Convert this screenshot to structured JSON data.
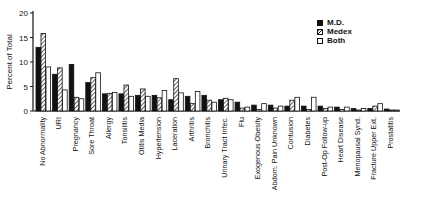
{
  "chart_data": {
    "type": "bar",
    "title": "",
    "xlabel": "",
    "ylabel": "Percent of Total",
    "ylim": [
      0,
      20
    ],
    "yticks": [
      0,
      5,
      10,
      15,
      20
    ],
    "grid": false,
    "legend_position": "top-right",
    "categories": [
      "No Abnormality",
      "URI",
      "Pregnancy",
      "Sore Throat",
      "Allergy",
      "Tonsilitis",
      "Otitis Media",
      "Hypertension",
      "Laceration",
      "Arthritis",
      "Bronchitis",
      "Urinary Tract Infec.",
      "Flu",
      "Exogenous Obesity",
      "Abdom. Pain Unknown",
      "Contusion",
      "Diabetes",
      "Post-Op Follow-up",
      "Heart Disease",
      "Menopausal Synd.",
      "Fracture Upper Ext.",
      "Prostatitis"
    ],
    "series": [
      {
        "name": "M.D.",
        "style": "solid",
        "values": [
          13.0,
          7.5,
          9.5,
          5.8,
          3.5,
          3.5,
          3.2,
          3.2,
          2.3,
          3.0,
          3.2,
          2.3,
          1.8,
          1.2,
          1.2,
          1.0,
          1.0,
          1.0,
          0.8,
          0.5,
          0.5,
          0.4
        ]
      },
      {
        "name": "Medex",
        "style": "hatched",
        "values": [
          15.8,
          8.8,
          2.8,
          6.8,
          3.6,
          5.3,
          4.5,
          2.7,
          6.6,
          1.5,
          2.2,
          2.6,
          0.6,
          0.3,
          0.6,
          2.2,
          0.3,
          0.5,
          0.3,
          0.2,
          1.0,
          0.2
        ]
      },
      {
        "name": "Both",
        "style": "open",
        "values": [
          9.0,
          4.3,
          2.5,
          7.8,
          3.8,
          3.0,
          3.0,
          4.2,
          3.7,
          4.0,
          1.8,
          2.3,
          0.8,
          1.5,
          1.0,
          2.8,
          2.8,
          0.8,
          0.8,
          0.5,
          1.5,
          0.2
        ]
      }
    ]
  },
  "legend": {
    "items": [
      {
        "label": "M.D."
      },
      {
        "label": "Medex"
      },
      {
        "label": "Both"
      }
    ]
  }
}
